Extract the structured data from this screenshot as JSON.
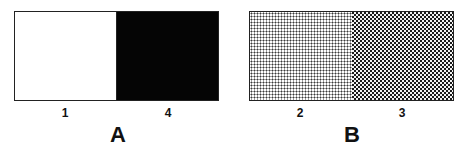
{
  "panels": [
    {
      "label": "A",
      "cells": [
        {
          "number": "1",
          "fill": "white",
          "color": "#ffffff"
        },
        {
          "number": "4",
          "fill": "black",
          "color": "#000000"
        }
      ]
    },
    {
      "label": "B",
      "cells": [
        {
          "number": "2",
          "fill": "light-dotted",
          "color": "#d8d8d8"
        },
        {
          "number": "3",
          "fill": "dark-dotted",
          "color": "#3a3a3a"
        }
      ]
    }
  ]
}
